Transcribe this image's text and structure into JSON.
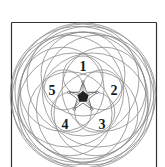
{
  "diagram": {
    "type": "five-fold overlapping circle rosette",
    "center": {
      "x": 83,
      "y": 96
    },
    "colors": {
      "frame": "#333333",
      "circles": "#8a8a8a",
      "center_pentagon": "#222222",
      "labels": "#1a1a1a"
    },
    "labels": [
      {
        "id": "1",
        "text": "1",
        "x": 83,
        "y": 71
      },
      {
        "id": "2",
        "text": "2",
        "x": 114,
        "y": 95
      },
      {
        "id": "3",
        "text": "3",
        "x": 102,
        "y": 129
      },
      {
        "id": "4",
        "text": "4",
        "x": 65,
        "y": 129
      },
      {
        "id": "5",
        "text": "5",
        "x": 52,
        "y": 95
      }
    ],
    "circle_rings": [
      {
        "radius": 20,
        "offset": 20
      },
      {
        "radius": 42,
        "offset": 22
      },
      {
        "radius": 56,
        "offset": 16
      },
      {
        "radius": 68,
        "offset": 5
      }
    ]
  }
}
